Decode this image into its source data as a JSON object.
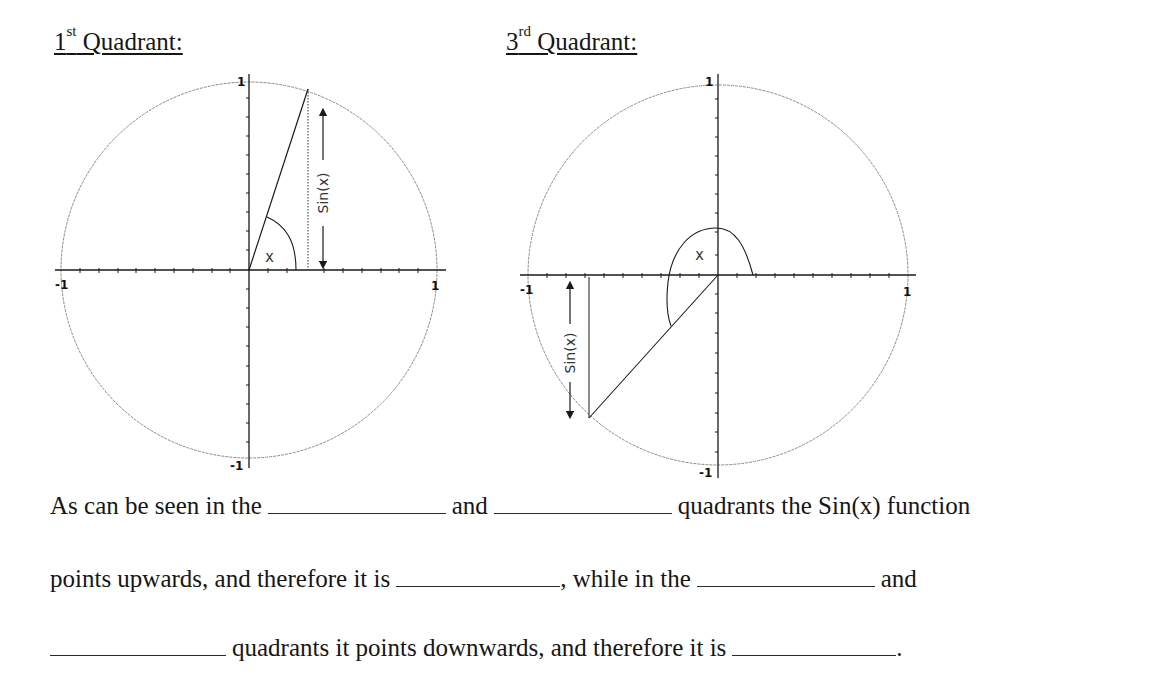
{
  "headings": {
    "first": {
      "num": "1",
      "sup": "st",
      "text": " Quadrant:"
    },
    "third": {
      "num": "3",
      "sup": "rd",
      "text": " Quadrant:"
    }
  },
  "diagrams": {
    "first_quadrant": {
      "axis_labels": {
        "top": "1",
        "bottom": "-1",
        "left": "-1",
        "right": "1"
      },
      "angle_label": "x",
      "sine_label": "Sin(x)"
    },
    "third_quadrant": {
      "axis_labels": {
        "top": "1",
        "bottom": "-1",
        "left": "-1",
        "right": "1"
      },
      "angle_label": "x",
      "sine_label": "Sin(x)"
    }
  },
  "paragraph": {
    "line1": {
      "a": "As can be seen in the",
      "b": "and",
      "c": "quadrants the Sin(x) function"
    },
    "line2": {
      "a": "points upwards, and therefore it is",
      "b": ", while in the",
      "c": "and"
    },
    "line3": {
      "a": "quadrants it points downwards, and therefore it is",
      "b": "."
    }
  },
  "colors": {
    "ink": "#161616",
    "circle": "#8a8a8a",
    "axis": "#1a1a1a"
  }
}
